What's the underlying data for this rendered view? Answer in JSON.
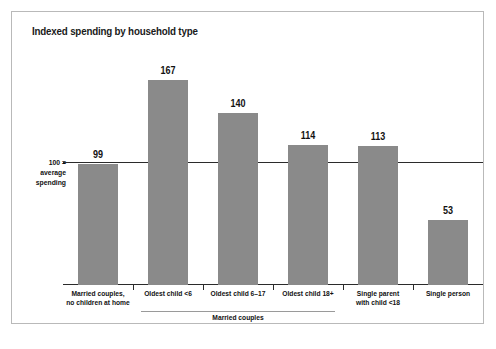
{
  "chart_data": {
    "type": "bar",
    "title": "Indexed spending by household type",
    "xlabel": "",
    "ylabel": "",
    "categories": [
      "Married couples,\nno children at home",
      "Oldest child <6",
      "Oldest child 6–17",
      "Oldest child 18+",
      "Single parent\nwith child <18",
      "Single person"
    ],
    "category_lines": [
      [
        "Married couples,",
        "no children at home"
      ],
      [
        "Oldest child <6",
        ""
      ],
      [
        "Oldest child 6–17",
        ""
      ],
      [
        "Oldest child 18+",
        ""
      ],
      [
        "Single parent",
        "with child <18"
      ],
      [
        "Single person",
        ""
      ]
    ],
    "values": [
      99,
      167,
      140,
      114,
      113,
      53
    ],
    "value_labels": [
      "99",
      "167",
      "140",
      "114",
      "113",
      "53"
    ],
    "ylim": [
      0,
      190
    ],
    "grid": false,
    "legend": "none",
    "bar_color": "#8a8a8a",
    "reference_line": {
      "value": 100,
      "label_lines": [
        "100 =",
        "average",
        "spending"
      ],
      "color": "#2b2b2b"
    },
    "group_bracket": {
      "label": "Married couples",
      "spans_categories": [
        1,
        2,
        3
      ]
    }
  },
  "colors": {
    "bar": "#8a8a8a",
    "axis": "#2b2b2b",
    "frame_border": "#b9b9b9",
    "text": "#111111",
    "bracket": "#9a9a9a"
  }
}
